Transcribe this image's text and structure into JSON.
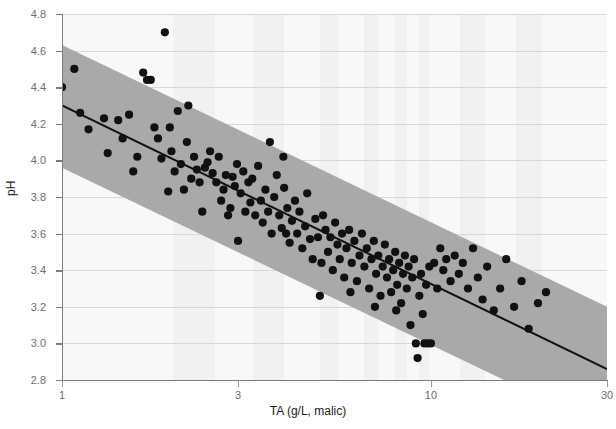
{
  "chart_data": {
    "type": "scatter",
    "title": "",
    "xlabel": "TA (g/L, malic)",
    "ylabel": "pH",
    "xscale": "log",
    "yscale": "linear",
    "xlim": [
      1,
      30
    ],
    "ylim": [
      2.8,
      4.8
    ],
    "xticks": [
      1,
      3,
      10,
      30
    ],
    "xtick_labels": [
      "1",
      "3",
      "10",
      "30"
    ],
    "yticks": [
      2.8,
      3.0,
      3.2,
      3.4,
      3.6,
      3.8,
      4.0,
      4.2,
      4.4,
      4.6,
      4.8
    ],
    "ytick_labels": [
      "2.8",
      "3.0",
      "3.2",
      "3.4",
      "3.6",
      "3.8",
      "4.0",
      "4.2",
      "4.4",
      "4.6",
      "4.8"
    ],
    "grid": "horizontal",
    "legend": "none",
    "marker_color": "#111111",
    "line_color": "#111111",
    "band_color": "#a9a9a9",
    "background_color": "#f8f8f8",
    "axis_color": "#7d7d7d",
    "fit_line": {
      "label": "regression line",
      "x": [
        1,
        30
      ],
      "y": [
        4.3,
        2.86
      ]
    },
    "confidence_band": {
      "label": "prediction band",
      "x": [
        1,
        30
      ],
      "upper": [
        4.63,
        3.2
      ],
      "lower": [
        3.96,
        2.53
      ]
    },
    "points": [
      [
        1.0,
        4.4
      ],
      [
        1.08,
        4.5
      ],
      [
        1.12,
        4.26
      ],
      [
        1.18,
        4.17
      ],
      [
        1.3,
        4.23
      ],
      [
        1.33,
        4.04
      ],
      [
        1.42,
        4.22
      ],
      [
        1.46,
        4.12
      ],
      [
        1.52,
        4.25
      ],
      [
        1.56,
        3.94
      ],
      [
        1.6,
        4.02
      ],
      [
        1.66,
        4.48
      ],
      [
        1.7,
        4.44
      ],
      [
        1.74,
        4.44
      ],
      [
        1.78,
        4.18
      ],
      [
        1.82,
        4.12
      ],
      [
        1.86,
        4.01
      ],
      [
        1.9,
        4.7
      ],
      [
        1.94,
        3.83
      ],
      [
        1.98,
        4.05
      ],
      [
        2.02,
        3.94
      ],
      [
        2.06,
        4.27
      ],
      [
        2.1,
        3.98
      ],
      [
        2.14,
        3.84
      ],
      [
        2.18,
        4.1
      ],
      [
        2.24,
        3.9
      ],
      [
        2.28,
        4.02
      ],
      [
        2.32,
        3.95
      ],
      [
        2.36,
        3.88
      ],
      [
        2.4,
        3.72
      ],
      [
        2.44,
        3.96
      ],
      [
        2.48,
        3.99
      ],
      [
        2.52,
        4.05
      ],
      [
        2.56,
        3.93
      ],
      [
        2.62,
        3.88
      ],
      [
        2.66,
        4.02
      ],
      [
        2.7,
        3.78
      ],
      [
        2.74,
        3.84
      ],
      [
        2.78,
        3.92
      ],
      [
        2.82,
        3.7
      ],
      [
        2.86,
        3.74
      ],
      [
        2.9,
        3.91
      ],
      [
        2.94,
        3.86
      ],
      [
        2.98,
        3.98
      ],
      [
        3.0,
        3.56
      ],
      [
        3.05,
        3.82
      ],
      [
        3.1,
        3.94
      ],
      [
        3.14,
        3.72
      ],
      [
        3.2,
        3.88
      ],
      [
        3.24,
        3.77
      ],
      [
        3.28,
        3.9
      ],
      [
        3.34,
        3.7
      ],
      [
        3.4,
        3.97
      ],
      [
        3.46,
        3.78
      ],
      [
        3.5,
        3.66
      ],
      [
        3.56,
        3.84
      ],
      [
        3.62,
        3.72
      ],
      [
        3.66,
        4.1
      ],
      [
        3.7,
        3.6
      ],
      [
        3.76,
        3.8
      ],
      [
        3.82,
        3.92
      ],
      [
        3.88,
        3.7
      ],
      [
        3.94,
        3.63
      ],
      [
        4.0,
        3.85
      ],
      [
        4.08,
        3.74
      ],
      [
        4.14,
        3.55
      ],
      [
        4.2,
        3.67
      ],
      [
        4.28,
        3.78
      ],
      [
        4.34,
        3.6
      ],
      [
        4.4,
        3.72
      ],
      [
        4.48,
        3.52
      ],
      [
        4.56,
        3.64
      ],
      [
        4.62,
        3.82
      ],
      [
        4.7,
        3.57
      ],
      [
        4.78,
        3.46
      ],
      [
        4.86,
        3.68
      ],
      [
        4.94,
        3.58
      ],
      [
        5.0,
        3.26
      ],
      [
        5.1,
        3.7
      ],
      [
        5.18,
        3.62
      ],
      [
        5.26,
        3.5
      ],
      [
        5.34,
        3.58
      ],
      [
        5.42,
        3.4
      ],
      [
        5.5,
        3.66
      ],
      [
        5.58,
        3.54
      ],
      [
        5.66,
        3.46
      ],
      [
        5.74,
        3.6
      ],
      [
        5.82,
        3.36
      ],
      [
        5.9,
        3.52
      ],
      [
        6.0,
        3.62
      ],
      [
        6.1,
        3.44
      ],
      [
        6.2,
        3.56
      ],
      [
        6.3,
        3.34
      ],
      [
        6.4,
        3.48
      ],
      [
        6.5,
        3.6
      ],
      [
        6.6,
        3.42
      ],
      [
        6.7,
        3.52
      ],
      [
        6.8,
        3.3
      ],
      [
        6.9,
        3.46
      ],
      [
        7.0,
        3.56
      ],
      [
        7.1,
        3.38
      ],
      [
        7.2,
        3.48
      ],
      [
        7.3,
        3.26
      ],
      [
        7.4,
        3.42
      ],
      [
        7.5,
        3.54
      ],
      [
        7.6,
        3.36
      ],
      [
        7.7,
        3.46
      ],
      [
        7.8,
        3.28
      ],
      [
        7.9,
        3.4
      ],
      [
        8.0,
        3.5
      ],
      [
        8.1,
        3.32
      ],
      [
        8.2,
        3.44
      ],
      [
        8.3,
        3.22
      ],
      [
        8.4,
        3.38
      ],
      [
        8.5,
        3.48
      ],
      [
        8.6,
        3.3
      ],
      [
        8.7,
        3.42
      ],
      [
        8.8,
        3.1
      ],
      [
        8.9,
        3.36
      ],
      [
        9.0,
        3.46
      ],
      [
        9.1,
        3.0
      ],
      [
        9.2,
        2.92
      ],
      [
        9.3,
        3.26
      ],
      [
        9.4,
        3.38
      ],
      [
        9.5,
        3.16
      ],
      [
        9.6,
        3.0
      ],
      [
        9.7,
        3.32
      ],
      [
        9.8,
        3.0
      ],
      [
        9.9,
        3.42
      ],
      [
        10.0,
        3.0
      ],
      [
        10.2,
        3.44
      ],
      [
        10.4,
        3.3
      ],
      [
        10.6,
        3.52
      ],
      [
        10.8,
        3.4
      ],
      [
        11.0,
        3.46
      ],
      [
        11.3,
        3.34
      ],
      [
        11.6,
        3.48
      ],
      [
        11.9,
        3.38
      ],
      [
        12.2,
        3.44
      ],
      [
        12.6,
        3.3
      ],
      [
        13.0,
        3.52
      ],
      [
        13.4,
        3.36
      ],
      [
        13.8,
        3.24
      ],
      [
        14.2,
        3.42
      ],
      [
        14.8,
        3.18
      ],
      [
        15.4,
        3.3
      ],
      [
        16.0,
        3.46
      ],
      [
        16.8,
        3.2
      ],
      [
        17.6,
        3.34
      ],
      [
        18.4,
        3.08
      ],
      [
        19.5,
        3.22
      ],
      [
        20.5,
        3.28
      ],
      [
        3.98,
        4.02
      ],
      [
        4.05,
        3.6
      ],
      [
        2.2,
        4.3
      ],
      [
        1.96,
        4.18
      ],
      [
        6.05,
        3.28
      ],
      [
        7.05,
        3.2
      ],
      [
        5.05,
        3.44
      ],
      [
        8.05,
        3.18
      ]
    ]
  }
}
